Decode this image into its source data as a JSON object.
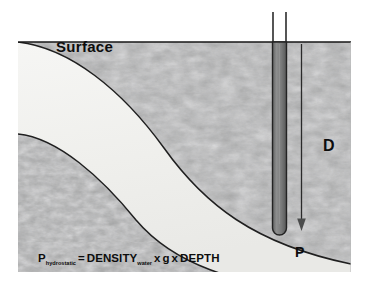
{
  "diagram": {
    "type": "geological-cross-section",
    "labels": {
      "surface": "Surface",
      "depth": "D",
      "pressure_point": "P"
    },
    "formula": {
      "full_text": "P hydrostatic = DENSITY water x g x DEPTH",
      "pressure_symbol": "P",
      "pressure_subscript": "hydrostatic",
      "equals": "=",
      "density_symbol": "DENSITY",
      "density_subscript": "water",
      "times_1": "x",
      "gravity_symbol": "g",
      "times_2": "x",
      "depth_symbol": "DEPTH"
    },
    "elements": {
      "rock_layer": "textured-gray-rock-strata",
      "water_band": "white-curved-aquifer-band",
      "well_pipe": "vertical-well-pipe",
      "depth_arrow": "downward-depth-arrow"
    },
    "colors": {
      "rock_base": "#9fa0a0",
      "rock_dark": "#7c7d7d",
      "rock_light": "#b9baba",
      "band_fill": "#f2f2f0",
      "outline": "#1a1a1a",
      "pipe_fill": "#7a7b7b",
      "pipe_edge": "#2b2b2b",
      "text": "#0d0d0d",
      "background": "#ffffff"
    }
  }
}
